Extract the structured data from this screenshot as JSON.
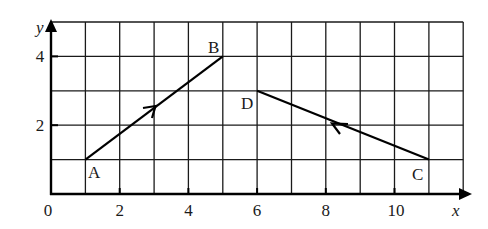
{
  "diagram": {
    "type": "coordinate-grid-vectors",
    "axes": {
      "x_label": "x",
      "y_label": "y",
      "x_ticks": [
        "0",
        "2",
        "4",
        "6",
        "8",
        "10"
      ],
      "y_ticks": [
        "2",
        "4"
      ],
      "x_range": [
        0,
        12
      ],
      "y_range": [
        0,
        5
      ],
      "grid_step": 1
    },
    "points": [
      {
        "name": "A",
        "x": 1,
        "y": 1
      },
      {
        "name": "B",
        "x": 5,
        "y": 4
      },
      {
        "name": "C",
        "x": 11,
        "y": 1
      },
      {
        "name": "D",
        "x": 6,
        "y": 3
      }
    ],
    "segments": [
      {
        "from": "A",
        "to": "B",
        "arrow_direction": "A-to-B"
      },
      {
        "from": "C",
        "to": "D",
        "arrow_direction": "C-to-D"
      }
    ],
    "colors": {
      "line": "#000000",
      "grid": "#1a1a1a",
      "background": "#ffffff"
    }
  }
}
